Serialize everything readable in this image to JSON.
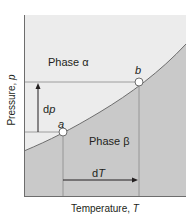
{
  "diagram": {
    "axes": {
      "xlabel": "Temperature, ",
      "xlabel_var": "T",
      "ylabel": "Pressure, ",
      "ylabel_var": "p"
    },
    "regions": {
      "upper": "Phase α",
      "lower": "Phase β"
    },
    "points": {
      "a": "a",
      "b": "b"
    },
    "arrows": {
      "dp": "d",
      "dp_var": "p",
      "dT": "d",
      "dT_var": "T"
    },
    "colors": {
      "phase_alpha_fill": "#ececec",
      "phase_beta_fill": "#c9c9c9",
      "line": "#6d6d6d",
      "text": "#231f20"
    }
  }
}
